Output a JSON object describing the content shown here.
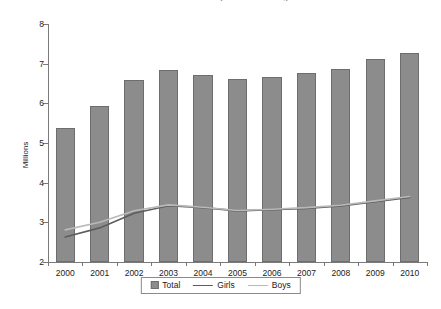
{
  "chart_data": {
    "type": "bar",
    "title": "Children Enrolled in Early Education Programmes",
    "xlabel": "",
    "ylabel": "Millions",
    "categories": [
      "2000",
      "2001",
      "2002",
      "2003",
      "2004",
      "2005",
      "2006",
      "2007",
      "2008",
      "2009",
      "2010"
    ],
    "ylim": [
      2,
      8
    ],
    "yticks": [
      "2",
      "3",
      "4",
      "5",
      "6",
      "7",
      "8"
    ],
    "grid": false,
    "legend_position": "bottom-center",
    "series": [
      {
        "name": "Total",
        "kind": "bar",
        "color": "#8c8c8c",
        "values": [
          5.38,
          5.93,
          6.58,
          6.84,
          6.72,
          6.61,
          6.66,
          6.77,
          6.86,
          7.11,
          7.26
        ]
      },
      {
        "name": "Girls",
        "kind": "line",
        "color": "#5d5d5d",
        "values": [
          2.63,
          2.86,
          3.23,
          3.42,
          3.37,
          3.29,
          3.32,
          3.35,
          3.41,
          3.52,
          3.63
        ]
      },
      {
        "name": "Boys",
        "kind": "line",
        "color": "#b9b9b9",
        "values": [
          2.81,
          3.0,
          3.29,
          3.44,
          3.38,
          3.3,
          3.33,
          3.37,
          3.43,
          3.54,
          3.65
        ]
      }
    ]
  },
  "legend": {
    "items": [
      {
        "label": "Total",
        "marker": "bar-swatch-icon"
      },
      {
        "label": "Girls",
        "marker": "line-swatch-icon"
      },
      {
        "label": "Boys",
        "marker": "line-swatch-light-icon"
      }
    ]
  }
}
